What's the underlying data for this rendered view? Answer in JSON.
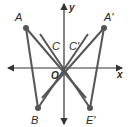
{
  "figure": {
    "type": "coordinate-plane-reflection",
    "axes": {
      "x_label": "x",
      "y_label": "y",
      "origin_label": "O"
    },
    "points": [
      {
        "name": "A",
        "label": "A"
      },
      {
        "name": "A_prime",
        "label": "A'"
      },
      {
        "name": "B",
        "label": "B"
      },
      {
        "name": "E_prime",
        "label": "E'"
      },
      {
        "name": "C",
        "label": "C"
      },
      {
        "name": "C_prime",
        "label": "C'"
      }
    ],
    "segments": [
      [
        "A",
        "O"
      ],
      [
        "A",
        "B"
      ],
      [
        "A_prime",
        "O"
      ],
      [
        "A_prime",
        "E_prime"
      ],
      [
        "B",
        "O"
      ],
      [
        "E_prime",
        "O"
      ]
    ],
    "colors": {
      "line": "#555555",
      "axis": "#333333",
      "point": "#555555",
      "text": "#2a2a2a"
    }
  }
}
